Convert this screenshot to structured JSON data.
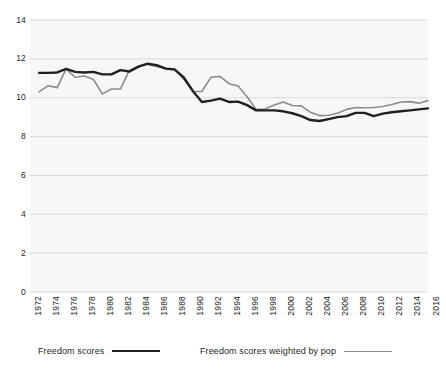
{
  "chart_data": {
    "type": "line",
    "title": "",
    "xlabel": "",
    "ylabel": "",
    "ylim": [
      0,
      14
    ],
    "yticks": [
      0,
      2,
      4,
      6,
      8,
      10,
      12,
      14
    ],
    "xlim": [
      1972,
      2016
    ],
    "xticks": [
      1972,
      1974,
      1976,
      1978,
      1980,
      1982,
      1984,
      1986,
      1988,
      1990,
      1992,
      1994,
      1996,
      1998,
      2000,
      2002,
      2004,
      2006,
      2008,
      2010,
      2012,
      2014,
      2016
    ],
    "grid": "horizontal",
    "legend_position": "bottom",
    "x": [
      1973,
      1974,
      1975,
      1976,
      1977,
      1978,
      1979,
      1980,
      1981,
      1982,
      1983,
      1984,
      1985,
      1986,
      1987,
      1988,
      1989,
      1990,
      1991,
      1992,
      1993,
      1994,
      1995,
      1996,
      1997,
      1998,
      1999,
      2000,
      2001,
      2002,
      2003,
      2004,
      2005,
      2006,
      2007,
      2008,
      2009,
      2010,
      2011,
      2012,
      2013,
      2014,
      2015,
      2016
    ],
    "series": [
      {
        "name": "Freedom scores",
        "color": "#231f20",
        "values": [
          11.28,
          11.28,
          11.3,
          11.48,
          11.33,
          11.3,
          11.33,
          11.2,
          11.2,
          11.42,
          11.35,
          11.6,
          11.75,
          11.68,
          11.5,
          11.45,
          11.05,
          10.35,
          9.78,
          9.85,
          9.95,
          9.78,
          9.8,
          9.62,
          9.35,
          9.35,
          9.35,
          9.3,
          9.2,
          9.05,
          8.85,
          8.8,
          8.9,
          9.0,
          9.05,
          9.22,
          9.22,
          9.05,
          9.18,
          9.25,
          9.3,
          9.35,
          9.4,
          9.45
        ]
      },
      {
        "name": "Freedom scores weighted by pop",
        "color": "#8c8c8c",
        "values": [
          10.3,
          10.62,
          10.52,
          11.48,
          11.05,
          11.12,
          10.95,
          10.2,
          10.45,
          10.45,
          11.42,
          11.62,
          11.72,
          11.6,
          11.52,
          11.45,
          10.95,
          10.32,
          10.32,
          11.05,
          11.1,
          10.72,
          10.6,
          10.05,
          9.4,
          9.42,
          9.62,
          9.78,
          9.6,
          9.58,
          9.25,
          9.08,
          9.1,
          9.2,
          9.4,
          9.5,
          9.48,
          9.5,
          9.55,
          9.65,
          9.78,
          9.8,
          9.72,
          9.85
        ]
      }
    ]
  },
  "axes": {
    "y_tick_labels": [
      "14",
      "12",
      "10",
      "8",
      "6",
      "4",
      "2",
      "0"
    ],
    "x_tick_labels": [
      "1972",
      "1974",
      "1976",
      "1978",
      "1980",
      "1982",
      "1984",
      "1986",
      "1988",
      "1990",
      "1992",
      "1994",
      "1996",
      "1998",
      "2000",
      "2002",
      "2004",
      "2006",
      "2008",
      "2010",
      "2012",
      "2014",
      "2016"
    ]
  },
  "legend": {
    "items": [
      {
        "label": "Freedom scores",
        "color": "#231f20"
      },
      {
        "label": "Freedom scores weighted by pop",
        "color": "#8c8c8c"
      }
    ]
  },
  "colors": {
    "background": "#ffffff",
    "plot_background": "#f7f7f5",
    "gridline": "#d5d5d3",
    "text": "#231f20",
    "series_primary": "#231f20",
    "series_secondary": "#8c8c8c"
  }
}
